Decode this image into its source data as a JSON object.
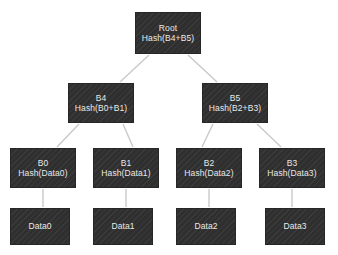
{
  "diagram": {
    "background_color": "#ffffff",
    "node_fill_color": "#2f2f2f",
    "node_text_color": "#e9e9e9",
    "edge_color": "#c9c9c9",
    "levels": [
      {
        "name": "root-level",
        "nodes": [
          {
            "id": "root",
            "line1": "Root",
            "line2": "Hash(B4+B5)",
            "x": 135,
            "y": 12,
            "w": 66,
            "h": 42
          }
        ]
      },
      {
        "name": "branch-level",
        "nodes": [
          {
            "id": "b4",
            "line1": "B4",
            "line2": "Hash(B0+B1)",
            "x": 68,
            "y": 83,
            "w": 66,
            "h": 40
          },
          {
            "id": "b5",
            "line1": "B5",
            "line2": "Hash(B2+B3)",
            "x": 202,
            "y": 83,
            "w": 66,
            "h": 40
          }
        ]
      },
      {
        "name": "leaf-hash-level",
        "nodes": [
          {
            "id": "b0",
            "line1": "B0",
            "line2": "Hash(Data0)",
            "x": 10,
            "y": 148,
            "w": 66,
            "h": 40
          },
          {
            "id": "b1",
            "line1": "B1",
            "line2": "Hash(Data1)",
            "x": 93,
            "y": 148,
            "w": 66,
            "h": 40
          },
          {
            "id": "b2",
            "line1": "B2",
            "line2": "Hash(Data2)",
            "x": 176,
            "y": 148,
            "w": 66,
            "h": 40
          },
          {
            "id": "b3",
            "line1": "B3",
            "line2": "Hash(Data3)",
            "x": 259,
            "y": 148,
            "w": 66,
            "h": 40
          }
        ]
      },
      {
        "name": "data-level",
        "nodes": [
          {
            "id": "data0",
            "line1": "Data0",
            "line2": "",
            "x": 10,
            "y": 208,
            "w": 60,
            "h": 37
          },
          {
            "id": "data1",
            "line1": "Data1",
            "line2": "",
            "x": 93,
            "y": 208,
            "w": 60,
            "h": 37
          },
          {
            "id": "data2",
            "line1": "Data2",
            "line2": "",
            "x": 176,
            "y": 208,
            "w": 60,
            "h": 37
          },
          {
            "id": "data3",
            "line1": "Data3",
            "line2": "",
            "x": 265,
            "y": 208,
            "w": 60,
            "h": 37
          }
        ]
      }
    ],
    "edges": [
      {
        "id": "root-b4",
        "from": "root",
        "to": "b4",
        "x1": 149,
        "y1": 55,
        "x2": 120,
        "y2": 82
      },
      {
        "id": "root-b5",
        "from": "root",
        "to": "b5",
        "x1": 188,
        "y1": 55,
        "x2": 217,
        "y2": 82
      },
      {
        "id": "b4-b0",
        "from": "b4",
        "to": "b0",
        "x1": 79,
        "y1": 124,
        "x2": 57,
        "y2": 147
      },
      {
        "id": "b4-b1",
        "from": "b4",
        "to": "b1",
        "x1": 123,
        "y1": 124,
        "x2": 133,
        "y2": 147
      },
      {
        "id": "b5-b2",
        "from": "b5",
        "to": "b2",
        "x1": 213,
        "y1": 124,
        "x2": 202,
        "y2": 147
      },
      {
        "id": "b5-b3",
        "from": "b5",
        "to": "b3",
        "x1": 257,
        "y1": 124,
        "x2": 281,
        "y2": 147
      },
      {
        "id": "b0-data0",
        "from": "b0",
        "to": "data0",
        "x1": 43,
        "y1": 189,
        "x2": 43,
        "y2": 207
      },
      {
        "id": "b1-data1",
        "from": "b1",
        "to": "data1",
        "x1": 126,
        "y1": 189,
        "x2": 126,
        "y2": 207
      },
      {
        "id": "b2-data2",
        "from": "b2",
        "to": "data2",
        "x1": 209,
        "y1": 189,
        "x2": 209,
        "y2": 207
      },
      {
        "id": "b3-data3",
        "from": "b3",
        "to": "data3",
        "x1": 292,
        "y1": 189,
        "x2": 292,
        "y2": 207
      }
    ]
  }
}
